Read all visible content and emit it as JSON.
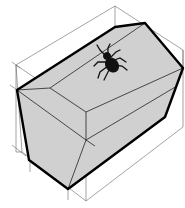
{
  "diagram": {
    "title": "Truncated box with spider on top face",
    "colors": {
      "face_fill": "#d0d0d0",
      "outline": "#000000",
      "construction": "#555555",
      "background": "#ffffff"
    },
    "nodes": [
      {
        "id": "spider",
        "label": "spider"
      },
      {
        "id": "polyhedron",
        "label": "truncated box"
      },
      {
        "id": "bounding-box",
        "label": "bounding box"
      }
    ]
  }
}
